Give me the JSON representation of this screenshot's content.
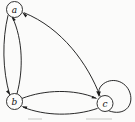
{
  "figure": {
    "kind": "directed-graph",
    "width": 135,
    "height": 122,
    "background_color": "#fbfbfa",
    "stroke_color": "#1d1d1d",
    "node_fill_color": "#fdfdfc"
  },
  "nodes": [
    {
      "id": "a",
      "label": "a",
      "cx": 14.5,
      "cy": 9.5,
      "r": 8.0
    },
    {
      "id": "b",
      "label": "b",
      "cx": 14.5,
      "cy": 101.5,
      "r": 8.0
    },
    {
      "id": "c",
      "label": "c",
      "cx": 105.0,
      "cy": 103.5,
      "r": 8.0
    }
  ],
  "edges": [
    {
      "from": "a",
      "to": "b",
      "style": "curved-left"
    },
    {
      "from": "b",
      "to": "a",
      "style": "curved-right"
    },
    {
      "from": "b",
      "to": "c",
      "style": "curved-up"
    },
    {
      "from": "c",
      "to": "b",
      "style": "curved-down"
    },
    {
      "from": "c",
      "to": "a",
      "style": "long-curve"
    },
    {
      "from": "c",
      "to": "c",
      "style": "self-loop-right"
    }
  ],
  "caption": {
    "partial_text_1": "",
    "partial_text_2": ""
  }
}
